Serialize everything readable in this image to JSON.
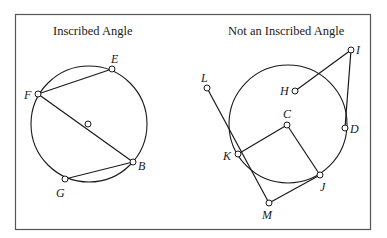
{
  "figure": {
    "panels": [
      {
        "id": "inscribed",
        "title": "Inscribed Angle",
        "circle": {
          "cx": 89,
          "cy": 124,
          "r": 58
        },
        "center_point": {
          "x": 88,
          "y": 124
        },
        "points": [
          {
            "name": "E",
            "x": 112,
            "y": 69,
            "lx": 111,
            "ly": 63
          },
          {
            "name": "F",
            "x": 38,
            "y": 94,
            "lx": 24,
            "ly": 99
          },
          {
            "name": "B",
            "x": 133,
            "y": 162,
            "lx": 138,
            "ly": 170
          },
          {
            "name": "G",
            "x": 65,
            "y": 179,
            "lx": 56,
            "ly": 197
          }
        ],
        "segments": [
          [
            "F",
            "E"
          ],
          [
            "F",
            "B"
          ],
          [
            "G",
            "B"
          ]
        ]
      },
      {
        "id": "not-inscribed",
        "title": "Not an Inscribed Angle",
        "circle": {
          "cx": 288,
          "cy": 124,
          "r": 59
        },
        "points": [
          {
            "name": "I",
            "x": 351,
            "y": 50,
            "lx": 356,
            "ly": 54
          },
          {
            "name": "H",
            "x": 295,
            "y": 91,
            "lx": 280,
            "ly": 95
          },
          {
            "name": "L",
            "x": 207,
            "y": 88,
            "lx": 201,
            "ly": 82
          },
          {
            "name": "C",
            "x": 287,
            "y": 125,
            "lx": 283,
            "ly": 118
          },
          {
            "name": "D",
            "x": 345,
            "y": 128,
            "lx": 350,
            "ly": 133
          },
          {
            "name": "K",
            "x": 238,
            "y": 154,
            "lx": 223,
            "ly": 160
          },
          {
            "name": "J",
            "x": 320,
            "y": 175,
            "lx": 320,
            "ly": 191
          },
          {
            "name": "M",
            "x": 269,
            "y": 203,
            "lx": 262,
            "ly": 219
          }
        ],
        "segments": [
          [
            "H",
            "I"
          ],
          [
            "I",
            "D"
          ],
          [
            "L",
            "M"
          ],
          [
            "M",
            "J"
          ],
          [
            "K",
            "C"
          ],
          [
            "C",
            "J"
          ]
        ]
      }
    ]
  }
}
